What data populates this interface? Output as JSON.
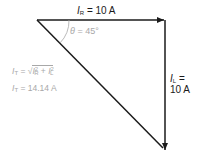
{
  "diagram": {
    "type": "phasor-triangle",
    "colors": {
      "lines": "#1a1a1a",
      "annotation": "#a8a8a8",
      "background": "#ffffff"
    },
    "labels": {
      "ir_symbol": "I",
      "ir_sub": "R",
      "ir_value": " = 10 A",
      "angle_symbol": "θ",
      "angle_value": " = 45°",
      "il_symbol": "I",
      "il_sub": "L",
      "il_eq": " =",
      "il_value": "10 A",
      "it_formula_symbol": "I",
      "it_formula_sub": "T",
      "it_formula_eq": " = √",
      "it_formula_r": "I",
      "it_formula_r_sub": "R",
      "it_formula_r_sup": "2",
      "it_formula_plus": " + ",
      "it_formula_l": "I",
      "it_formula_l_sub": "L",
      "it_formula_l_sup": "2",
      "it_result_symbol": "I",
      "it_result_sub": "T",
      "it_result_value": " = 14.14 A"
    },
    "vectors": [
      {
        "name": "I_R",
        "from": [
          37,
          20
        ],
        "to": [
          165,
          20
        ],
        "arrow": true
      },
      {
        "name": "I_L",
        "from": [
          165,
          20
        ],
        "to": [
          165,
          150
        ],
        "arrow": true
      },
      {
        "name": "I_T",
        "from": [
          37,
          20
        ],
        "to": [
          163,
          148
        ],
        "arrow": false
      }
    ]
  }
}
